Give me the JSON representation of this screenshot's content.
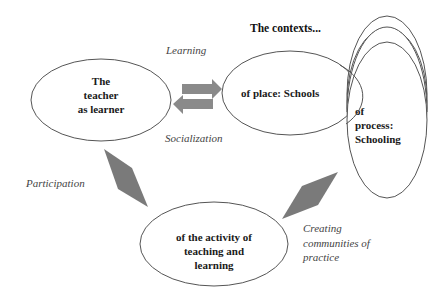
{
  "diagram": {
    "title": "The contexts...",
    "nodes": {
      "teacher": {
        "lines": [
          "The",
          "teacher",
          "as learner"
        ]
      },
      "place": {
        "label": "of place: Schools"
      },
      "process": {
        "lines": [
          "of",
          "process:",
          "Schooling"
        ]
      },
      "activity": {
        "lines": [
          "of the activity of",
          "teaching and",
          "learning"
        ]
      }
    },
    "edges": {
      "learning": {
        "label": "Learning"
      },
      "socialization": {
        "label": "Socialization"
      },
      "participation": {
        "label": "Participation"
      },
      "communities": {
        "lines": [
          "Creating",
          "communities of",
          "practice"
        ]
      }
    },
    "colors": {
      "stroke": "#555555",
      "arrow_fill": "#8a8a8a",
      "diamond_fill": "#7a7a7a"
    }
  }
}
